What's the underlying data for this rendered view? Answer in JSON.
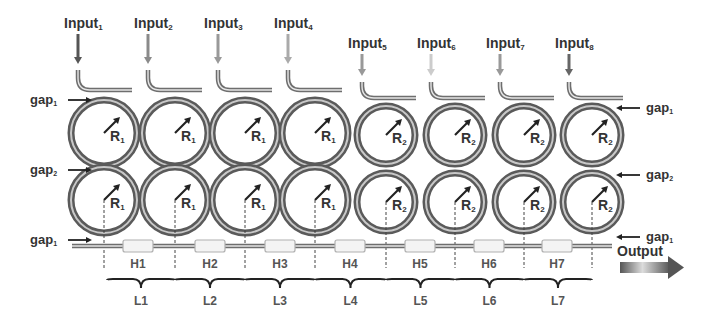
{
  "diagram": {
    "inputs": [
      {
        "label": "Input",
        "sub": "1",
        "x": 78,
        "arrow_color": "#555555"
      },
      {
        "label": "Input",
        "sub": "2",
        "x": 148,
        "arrow_color": "#8a8a8a"
      },
      {
        "label": "Input",
        "sub": "3",
        "x": 218,
        "arrow_color": "#999999"
      },
      {
        "label": "Input",
        "sub": "4",
        "x": 288,
        "arrow_color": "#aaaaaa"
      },
      {
        "label": "Input",
        "sub": "5",
        "x": 362,
        "arrow_color": "#999999"
      },
      {
        "label": "Input",
        "sub": "6",
        "x": 431,
        "arrow_color": "#cccccc"
      },
      {
        "label": "Input",
        "sub": "7",
        "x": 500,
        "arrow_color": "#999999"
      },
      {
        "label": "Input",
        "sub": "8",
        "x": 569,
        "arrow_color": "#666666"
      }
    ],
    "rings_top": [
      {
        "radius_label": "R",
        "sub": "1",
        "cx": 104
      },
      {
        "radius_label": "R",
        "sub": "1",
        "cx": 175
      },
      {
        "radius_label": "R",
        "sub": "1",
        "cx": 245
      },
      {
        "radius_label": "R",
        "sub": "1",
        "cx": 315
      },
      {
        "radius_label": "R",
        "sub": "2",
        "cx": 386
      },
      {
        "radius_label": "R",
        "sub": "2",
        "cx": 455
      },
      {
        "radius_label": "R",
        "sub": "2",
        "cx": 524
      },
      {
        "radius_label": "R",
        "sub": "2",
        "cx": 592
      }
    ],
    "rings_bottom": [
      {
        "radius_label": "R",
        "sub": "1",
        "cx": 104
      },
      {
        "radius_label": "R",
        "sub": "1",
        "cx": 175
      },
      {
        "radius_label": "R",
        "sub": "1",
        "cx": 245
      },
      {
        "radius_label": "R",
        "sub": "1",
        "cx": 315
      },
      {
        "radius_label": "R",
        "sub": "2",
        "cx": 386
      },
      {
        "radius_label": "R",
        "sub": "2",
        "cx": 455
      },
      {
        "radius_label": "R",
        "sub": "2",
        "cx": 524
      },
      {
        "radius_label": "R",
        "sub": "2",
        "cx": 592
      }
    ],
    "gap_labels": {
      "left": [
        {
          "label": "gap",
          "sub": "1",
          "y": 100
        },
        {
          "label": "gap",
          "sub": "2",
          "y": 170
        },
        {
          "label": "gap",
          "sub": "1",
          "y": 240
        }
      ],
      "right": [
        {
          "label": "gap",
          "sub": "1",
          "y": 108
        },
        {
          "label": "gap",
          "sub": "2",
          "y": 175
        },
        {
          "label": "gap",
          "sub": "1",
          "y": 237
        }
      ]
    },
    "heaters": [
      {
        "label": "H1",
        "x": 138
      },
      {
        "label": "H2",
        "x": 210
      },
      {
        "label": "H3",
        "x": 280
      },
      {
        "label": "H4",
        "x": 350
      },
      {
        "label": "H5",
        "x": 420
      },
      {
        "label": "H6",
        "x": 489
      },
      {
        "label": "H7",
        "x": 557
      }
    ],
    "lengths": [
      {
        "label": "L1",
        "x0": 107,
        "x1": 175
      },
      {
        "label": "L2",
        "x0": 175,
        "x1": 245
      },
      {
        "label": "L3",
        "x0": 245,
        "x1": 315
      },
      {
        "label": "L4",
        "x0": 315,
        "x1": 386
      },
      {
        "label": "L5",
        "x0": 386,
        "x1": 455
      },
      {
        "label": "L6",
        "x0": 455,
        "x1": 524
      },
      {
        "label": "L7",
        "x0": 524,
        "x1": 592
      }
    ],
    "output": {
      "label": "Output"
    },
    "colors": {
      "waveguide": "#6e6e6e",
      "ring_outer": "#5a5a5a",
      "ring_inner": "#9a9a9a",
      "heater_fill": "#f4f4f4",
      "heater_stroke": "#b0b0b0",
      "text": "#333333"
    }
  }
}
